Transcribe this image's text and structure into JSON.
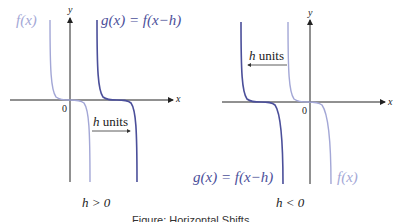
{
  "colors": {
    "shifted_curve": "#4b4f9a",
    "original_curve": "#a3a7d6",
    "axes": "#222222"
  },
  "left_panel": {
    "original_label": "f(x)",
    "shifted_label": "g(x) = f(x−h)",
    "shift_label_h": "h",
    "shift_label_units": "units",
    "axis_x": "x",
    "axis_y": "y",
    "origin": "0",
    "condition": "h > 0",
    "arrow_direction": "right"
  },
  "right_panel": {
    "original_label": "f(x)",
    "shifted_label": "g(x) = f(x−h)",
    "shift_label_h": "h",
    "shift_label_units": "units",
    "axis_x": "x",
    "axis_y": "y",
    "origin": "0",
    "condition": "h < 0",
    "arrow_direction": "left"
  },
  "caption": "Figure: Horizontal Shifts"
}
